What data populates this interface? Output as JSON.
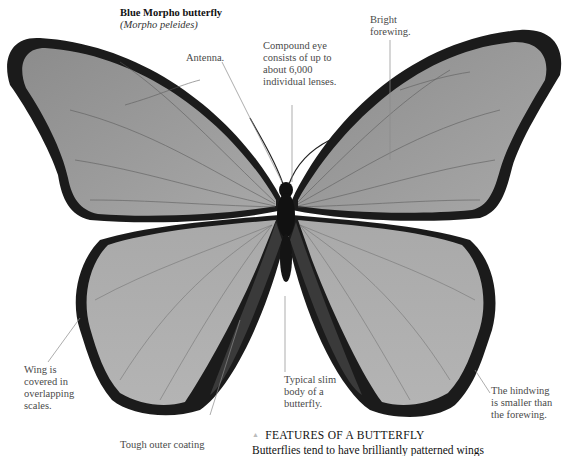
{
  "title": {
    "common_name": "Blue Morpho butterfly",
    "scientific_name": "(Morpho peleides)"
  },
  "labels": {
    "antenna": "Antenna.",
    "compound_eye": "Compound eye\nconsists of up to\nabout 6,000\nindividual lenses.",
    "bright_forewing": "Bright\nforewing.",
    "wing_scales": "Wing is\ncovered in\noverlapping\nscales.",
    "slim_body": "Typical slim\nbody of a\nbutterfly.",
    "hindwing": "The hindwing\nis smaller than\nthe forewing.",
    "outer_coating": "Tough outer coating"
  },
  "section": {
    "icon": "triangle-up-icon",
    "heading": "FEATURES OF A BUTTERFLY",
    "body": "Butterflies tend to have brilliantly patterned wings"
  },
  "colors": {
    "wing_fill": "#9a9a9a",
    "wing_edge": "#1a1a1a",
    "body": "#111111",
    "leader_line": "#888888"
  }
}
